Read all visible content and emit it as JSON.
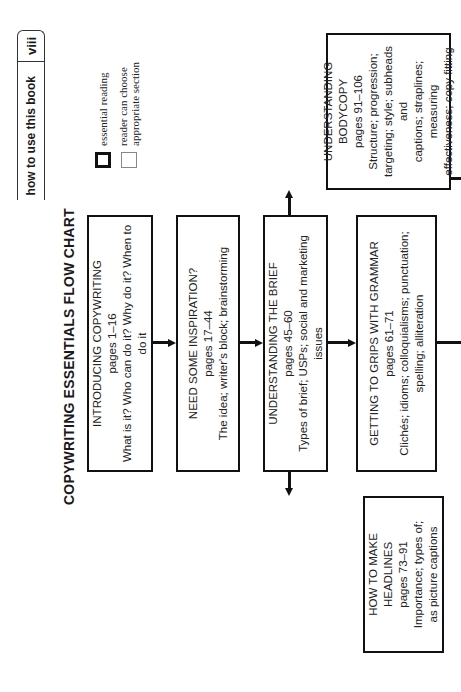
{
  "header": {
    "page_number": "viii",
    "section": "how to use this book"
  },
  "title": "COPYWRITING ESSENTIALS FLOW CHART",
  "legend": {
    "essential": "essential reading",
    "optional_line1": "reader can choose",
    "optional_line2": "appropriate section"
  },
  "boxes": {
    "introducing": {
      "heading": "INTRODUCING COPYWRITING",
      "pages": "pages 1–16",
      "topics": "What is it? Who can do it? Why do it? When to do it"
    },
    "inspiration": {
      "heading": "NEED SOME INSPIRATION?",
      "pages": "pages 17–44",
      "topics": "The idea; writer's block; brainstorming"
    },
    "brief": {
      "heading": "UNDERSTANDING THE BRIEF",
      "pages": "pages 45–60",
      "topics": "Types of brief; USPs; social and marketing issues"
    },
    "grammar": {
      "heading": "GETTING TO GRIPS WITH GRAMMAR",
      "pages": "pages 61–71",
      "topics_line1": "Clichés; idioms; colloquialisms; punctuation;",
      "topics_line2": "spelling; alliteration"
    },
    "bodycopy": {
      "heading_line1": "UNDERSTANDING",
      "heading_line2": "BODYCOPY",
      "pages": "pages 91–106",
      "topics_line1": "Structure; progression;",
      "topics_line2": "targeting; style; subheads and",
      "topics_line3": "captions; straplines; measuring",
      "topics_line4": "effectiveness; copy fitting"
    },
    "headlines": {
      "heading": "HOW TO MAKE HEADLINES",
      "pages": "pages 73–91",
      "topics_line1": "Importance; types of;",
      "topics_line2": "as picture captions"
    }
  },
  "colors": {
    "ink": "#111111",
    "background": "#ffffff"
  }
}
